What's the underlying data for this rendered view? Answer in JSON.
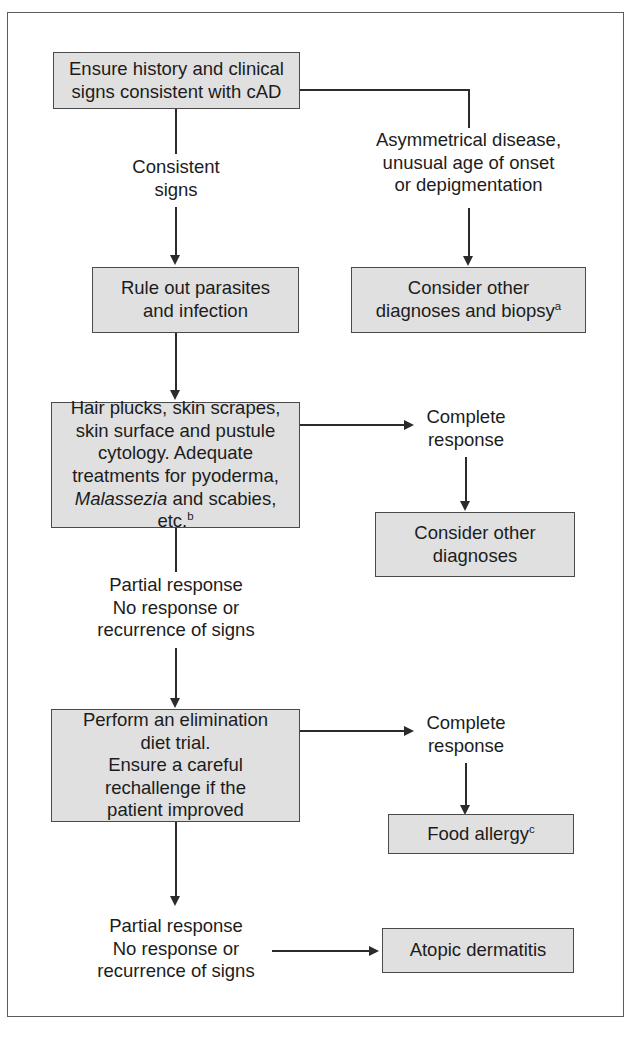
{
  "figure": {
    "type": "clinical-diagnostic-flowchart",
    "border_color": "#5b5b5b",
    "node_fill": "#e0e0e0",
    "node_border": "#4a4a4a",
    "line_color": "#2b2b2b"
  },
  "nodes": {
    "ensure_history": {
      "line1": "Ensure history and clinical",
      "line2": "signs consistent with cAD"
    },
    "rule_out": {
      "line1": "Rule out parasites",
      "line2": "and infection"
    },
    "consider_other_biopsy": {
      "line1": "Consider other",
      "line2": "diagnoses and biopsy",
      "footnote": "a"
    },
    "diagnostics": {
      "line1": "Hair plucks, skin scrapes,",
      "line2": "skin surface and pustule",
      "line3": "cytology. Adequate",
      "line4": "treatments for pyoderma,",
      "line5_italic": "Malassezia",
      "line5_rest": " and scabies, etc.",
      "footnote": "b"
    },
    "consider_other": {
      "line1": "Consider other",
      "line2": "diagnoses"
    },
    "elimination_diet": {
      "line1": "Perform an elimination",
      "line2": "diet trial.",
      "line3": "Ensure a careful",
      "line4": "rechallenge if the",
      "line5": "patient improved"
    },
    "food_allergy": {
      "line1": "Food allergy",
      "footnote": "c"
    },
    "atopic_dermatitis": {
      "line1": "Atopic dermatitis"
    }
  },
  "edge_labels": {
    "consistent_signs": {
      "line1": "Consistent",
      "line2": "signs"
    },
    "asymmetrical": {
      "line1": "Asymmetrical disease,",
      "line2": "unusual age of onset",
      "line3": "or depigmentation"
    },
    "complete_response_1": {
      "line1": "Complete",
      "line2": "response"
    },
    "partial_no_response_1": {
      "line1": "Partial response",
      "line2": "No response or",
      "line3": "recurrence of signs"
    },
    "complete_response_2": {
      "line1": "Complete",
      "line2": "response"
    },
    "partial_no_response_2": {
      "line1": "Partial response",
      "line2": "No response or",
      "line3": "recurrence of signs"
    }
  }
}
